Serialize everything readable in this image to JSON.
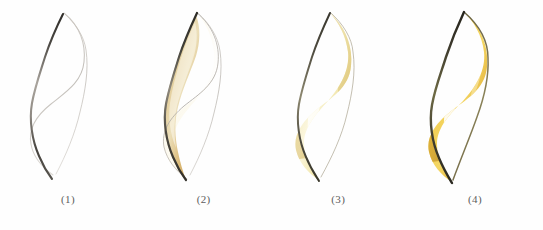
{
  "figure": {
    "background_color": "#fefefe",
    "panel_count": 4
  },
  "palette": {
    "background": "#fefefe",
    "pencil_light": "#b9b4ae",
    "pencil_dark": "#4a4742",
    "outline_dark": "#3b3a33",
    "outline_olive": "#6e6a45",
    "wash_pale": "#fbf7e6",
    "wash_cream": "#f5ecc8",
    "ochre_light": "#e3cd90",
    "ochre_mid": "#d6b264",
    "ochre_deep": "#bb8f3e",
    "yellow_pale": "#f6eeb8",
    "yellow_mid": "#eeda86",
    "yellow_warm": "#e8c95e",
    "gold_bright": "#f0c63c",
    "gold_deep": "#d9a62a",
    "amber_shadow": "#b8841c",
    "highlight_white": "#ffffff",
    "label_text": "#5d5d5d"
  },
  "panels": [
    {
      "id": "stage-1",
      "label": "(1)",
      "stage_name": "pencil-outline",
      "description": "Light pencil contour of the flame: a faint outer S-curve on the left and a darker S-curve through the centre.",
      "fill": "none",
      "has_color": false,
      "has_highlight": false
    },
    {
      "id": "stage-2",
      "label": "(2)",
      "stage_name": "first-ochre-wash",
      "description": "A thin ochre wash laid along the inner central curve; most of the shape still white paper.",
      "fill": "ochre-stroke",
      "has_color": true,
      "has_highlight": false
    },
    {
      "id": "stage-3",
      "label": "(3)",
      "stage_name": "full-yellow-wash",
      "description": "Pale yellow covers the whole flame, a broad white highlight reserved down the middle.",
      "fill": "pale-yellow",
      "has_color": true,
      "has_highlight": true
    },
    {
      "id": "stage-4",
      "label": "(4)",
      "stage_name": "saturated-gold",
      "description": "Deep saturated gold and amber shadows with a bright white core highlight; finished flame.",
      "fill": "deep-gold",
      "has_color": true,
      "has_highlight": true
    }
  ]
}
